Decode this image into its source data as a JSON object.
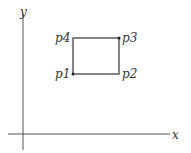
{
  "diagram": {
    "axes": {
      "x_label": "x",
      "y_label": "y"
    },
    "points": [
      {
        "name": "p1",
        "label": "p1",
        "dot": true
      },
      {
        "name": "p2",
        "label": "p2",
        "dot": false
      },
      {
        "name": "p3",
        "label": "p3",
        "dot": true
      },
      {
        "name": "p4",
        "label": "p4",
        "dot": false
      }
    ],
    "colors": {
      "line": "#333333",
      "background": "#ffffff"
    }
  }
}
